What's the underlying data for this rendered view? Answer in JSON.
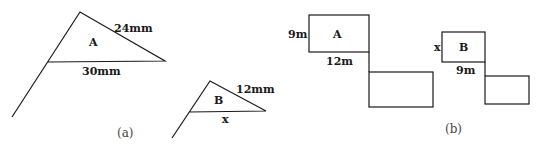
{
  "figure_a": {
    "caption": "(a)",
    "triangle_a": {
      "label": "A",
      "side_label": "24mm",
      "base_label": "30mm"
    },
    "triangle_b": {
      "label": "B",
      "side_label": "12mm",
      "base_label": "x"
    }
  },
  "figure_b": {
    "caption": "(b)",
    "rect_a": {
      "label": "A",
      "height_label": "9m",
      "width_label": "12m"
    },
    "rect_b": {
      "label": "B",
      "height_label": "x",
      "width_label": "9m"
    }
  }
}
